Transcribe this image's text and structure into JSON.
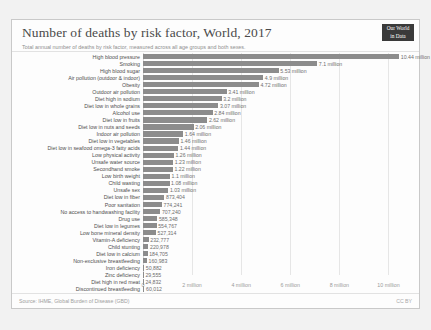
{
  "header": {
    "title": "Number of deaths by risk factor, World, 2017",
    "subtitle": "Total annual number of deaths by risk factor, measured across all age groups and both sexes.",
    "logo_line1": "Our World",
    "logo_line2": "in Data"
  },
  "footer": {
    "source": "Source: IHME, Global Burden of Disease (GBD)",
    "license": "CC BY"
  },
  "chart_data": {
    "type": "bar",
    "orientation": "horizontal",
    "title": "Number of deaths by risk factor, World, 2017",
    "subtitle": "Total annual number of deaths by risk factor, measured across all age groups and both sexes.",
    "xlabel": "",
    "ylabel": "",
    "xlim": [
      0,
      11000000
    ],
    "grid": true,
    "legend": false,
    "bar_color": "#8c8c8c",
    "xticks": [
      0,
      2000000,
      4000000,
      6000000,
      8000000,
      10000000
    ],
    "xtick_labels": [
      "0",
      "2 million",
      "4 million",
      "6 million",
      "8 million",
      "10 million"
    ],
    "categories": [
      "High blood pressure",
      "Smoking",
      "High blood sugar",
      "Air pollution (outdoor & indoor)",
      "Obesity",
      "Outdoor air pollution",
      "Diet high in sodium",
      "Diet low in whole grains",
      "Alcohol use",
      "Diet low in fruits",
      "Diet low in nuts and seeds",
      "Indoor air pollution",
      "Diet low in vegetables",
      "Diet low in seafood omega-3 fatty acids",
      "Low physical activity",
      "Unsafe water source",
      "Secondhand smoke",
      "Low birth weight",
      "Child wasting",
      "Unsafe sex",
      "Diet low in fiber",
      "Poor sanitation",
      "No access to handwashing facility",
      "Drug use",
      "Diet low in legumes",
      "Low bone mineral density",
      "Vitamin-A deficiency",
      "Child stunting",
      "Diet low in calcium",
      "Non-exclusive breastfeeding",
      "Iron deficiency",
      "Zinc deficiency",
      "Diet high in red meat",
      "Discontinued breastfeeding"
    ],
    "values": [
      10440000,
      7100000,
      5530000,
      4900000,
      4720000,
      3410000,
      3200000,
      3070000,
      2840000,
      2620000,
      2060000,
      1640000,
      1460000,
      1440000,
      1260000,
      1230000,
      1220000,
      1100000,
      1080000,
      1030000,
      873404,
      774241,
      707240,
      585348,
      554767,
      527314,
      232777,
      220978,
      184705,
      160983,
      50882,
      29555,
      24832,
      60012
    ],
    "value_labels": [
      "10.44 million",
      "7.1 million",
      "5.53 million",
      "4.9 million",
      "4.72 million",
      "3.41 million",
      "3.2 million",
      "3.07 million",
      "2.84 million",
      "2.62 million",
      "2.06 million",
      "1.64 million",
      "1.46 million",
      "1.44 million",
      "1.26 million",
      "1.23 million",
      "1.22 million",
      "1.1 million",
      "1.08 million",
      "1.03 million",
      "873,404",
      "774,241",
      "707,240",
      "585,348",
      "554,767",
      "527,314",
      "232,777",
      "220,978",
      "184,705",
      "160,983",
      "50,882",
      "29,555",
      "24,832",
      "60,012"
    ]
  }
}
